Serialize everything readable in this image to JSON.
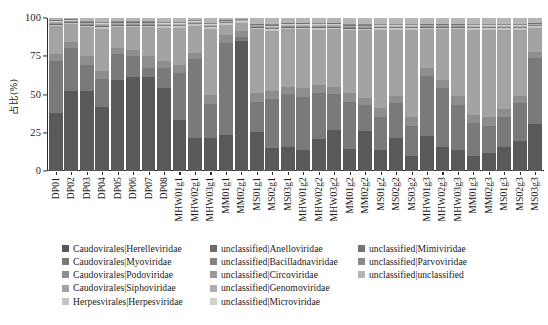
{
  "chart_data": {
    "type": "bar",
    "subtype": "stacked-percentage",
    "title": "",
    "xlabel": "",
    "ylabel": "占比(%)",
    "ylim": [
      0,
      100
    ],
    "yticks": [
      0,
      25,
      50,
      75,
      100
    ],
    "ytick_labels": [
      "0",
      "25",
      "50",
      "75",
      "100"
    ],
    "grid": false,
    "legend_position": "bottom",
    "legend_columns": 3,
    "palette": [
      "#595959",
      "#7a7a7a",
      "#8e8e8e",
      "#a3a3a3",
      "#c4c4c4",
      "#6b6b6b",
      "#848484",
      "#999999",
      "#adadad",
      "#d0d0d0",
      "#737373",
      "#8a8a8a",
      "#b5b5b5"
    ],
    "categories": [
      "DP01",
      "DP02",
      "DP03",
      "DP04",
      "DP05",
      "DP06",
      "DP07",
      "DP08",
      "MHW01g1",
      "MHW02g1",
      "MHW03g1",
      "MM01g1",
      "MM02g1",
      "MS01g1",
      "MS02g1",
      "MS03g1",
      "MHW01g2",
      "MHW02g2",
      "MHW03g2",
      "MM01g2",
      "MM02g2",
      "MS01g2",
      "MS02g2",
      "MS03g2",
      "MHW01g3",
      "MHW02g3",
      "MHW03g3",
      "MM01g3",
      "MM02g3",
      "MS01g3",
      "MS02g3",
      "MS03g3"
    ],
    "series": [
      {
        "name": "Caudovirales|Herelleviridae",
        "color": "#595959",
        "values": [
          38,
          53,
          53,
          42,
          60,
          62,
          62,
          55,
          34,
          22,
          22,
          24,
          85,
          26,
          15,
          16,
          14,
          21,
          27,
          15,
          27,
          14,
          22,
          10,
          23,
          16,
          14,
          10,
          12,
          16,
          20,
          31
        ]
      },
      {
        "name": "Caudovirales|Myoviridae",
        "color": "#7a7a7a",
        "values": [
          34,
          28,
          17,
          19,
          17,
          14,
          6,
          13,
          31,
          52,
          22,
          61,
          3,
          20,
          33,
          35,
          35,
          31,
          24,
          31,
          17,
          22,
          23,
          20,
          40,
          39,
          30,
          22,
          18,
          20,
          25,
          44
        ]
      },
      {
        "name": "Caudovirales|Podoviridae",
        "color": "#8e8e8e",
        "values": [
          5,
          4,
          6,
          5,
          4,
          4,
          8,
          5,
          5,
          4,
          6,
          5,
          4,
          6,
          5,
          5,
          6,
          5,
          5,
          6,
          5,
          6,
          5,
          6,
          5,
          5,
          6,
          5,
          6,
          5,
          5,
          4
        ]
      },
      {
        "name": "Caudovirales|Siphoviridae",
        "color": "#a3a3a3",
        "values": [
          18,
          12,
          19,
          28,
          14,
          15,
          19,
          22,
          25,
          18,
          44,
          7,
          5,
          42,
          40,
          38,
          39,
          37,
          38,
          42,
          45,
          52,
          44,
          58,
          26,
          34,
          44,
          57,
          58,
          53,
          44,
          16
        ]
      },
      {
        "name": "Herpesvirales|Herpesviridae",
        "color": "#c4c4c4",
        "values": [
          1,
          1,
          1,
          1,
          1,
          1,
          1,
          1,
          1,
          1,
          1,
          1,
          1,
          1,
          1,
          1,
          1,
          1,
          1,
          1,
          1,
          1,
          1,
          1,
          1,
          1,
          1,
          1,
          1,
          1,
          1,
          1
        ]
      },
      {
        "name": "unclassified|Anelloviridae",
        "color": "#6b6b6b",
        "values": [
          0.5,
          0.3,
          0.4,
          0.5,
          0.4,
          0.4,
          0.4,
          0.4,
          0.4,
          0.3,
          0.4,
          0.3,
          0.2,
          0.4,
          0.5,
          0.5,
          0.5,
          0.5,
          0.5,
          0.4,
          0.4,
          0.4,
          0.4,
          0.4,
          0.4,
          0.4,
          0.4,
          0.4,
          0.4,
          0.4,
          0.4,
          0.3
        ]
      },
      {
        "name": "unclassified|Bacilladnaviridae",
        "color": "#848484",
        "values": [
          0.4,
          0.3,
          0.3,
          0.4,
          0.3,
          0.3,
          0.3,
          0.3,
          0.3,
          0.3,
          0.3,
          0.3,
          0.2,
          0.3,
          0.4,
          0.4,
          0.4,
          0.4,
          0.4,
          0.3,
          0.3,
          0.3,
          0.3,
          0.3,
          0.3,
          0.3,
          0.3,
          0.3,
          0.3,
          0.3,
          0.3,
          0.3
        ]
      },
      {
        "name": "unclassified|Circoviridae",
        "color": "#999999",
        "values": [
          0.5,
          0.4,
          0.4,
          0.5,
          0.4,
          0.4,
          0.4,
          0.4,
          0.4,
          0.4,
          0.4,
          0.3,
          0.2,
          0.4,
          0.5,
          0.5,
          0.5,
          0.5,
          0.5,
          0.4,
          0.4,
          0.4,
          0.4,
          0.4,
          0.4,
          0.4,
          0.4,
          0.4,
          0.4,
          0.4,
          0.4,
          0.3
        ]
      },
      {
        "name": "unclassified|Genomoviridae",
        "color": "#adadad",
        "values": [
          0.5,
          0.4,
          0.4,
          0.5,
          0.4,
          0.4,
          0.4,
          0.4,
          0.4,
          0.4,
          0.4,
          0.3,
          0.2,
          0.4,
          0.5,
          0.5,
          0.5,
          0.5,
          0.5,
          0.4,
          0.4,
          0.4,
          0.4,
          0.4,
          0.4,
          0.4,
          0.4,
          0.4,
          0.4,
          0.4,
          0.4,
          0.3
        ]
      },
      {
        "name": "unclassified|Microviridae",
        "color": "#d0d0d0",
        "values": [
          0.6,
          0.4,
          0.5,
          0.6,
          0.5,
          0.5,
          0.5,
          0.5,
          0.5,
          0.4,
          0.5,
          0.4,
          0.2,
          0.5,
          0.6,
          0.6,
          0.6,
          0.6,
          0.6,
          0.5,
          0.5,
          0.5,
          0.5,
          0.5,
          0.5,
          0.5,
          0.5,
          0.5,
          0.5,
          0.5,
          0.5,
          0.4
        ]
      },
      {
        "name": "unclassified|Mimiviridae",
        "color": "#737373",
        "values": [
          0.5,
          0.4,
          0.4,
          0.5,
          0.4,
          0.4,
          0.4,
          0.4,
          0.4,
          0.4,
          0.4,
          0.3,
          0.2,
          0.4,
          0.5,
          0.5,
          0.5,
          0.5,
          0.5,
          0.4,
          0.4,
          0.4,
          0.4,
          0.4,
          0.4,
          0.4,
          0.4,
          0.4,
          0.4,
          0.4,
          0.4,
          0.3
        ]
      },
      {
        "name": "unclassified|Parvoviridae",
        "color": "#8a8a8a",
        "values": [
          0.5,
          0.4,
          0.4,
          0.5,
          0.4,
          0.4,
          0.4,
          0.4,
          0.4,
          0.4,
          0.4,
          0.3,
          0.2,
          0.4,
          0.5,
          0.5,
          0.5,
          0.5,
          0.5,
          0.4,
          0.4,
          0.4,
          0.4,
          0.4,
          0.4,
          0.4,
          0.4,
          0.4,
          0.4,
          0.4,
          0.4,
          0.3
        ]
      },
      {
        "name": "unclassified|unclassified",
        "color": "#b5b5b5",
        "values": [
          1,
          0.4,
          2.2,
          2.5,
          2.2,
          2.2,
          2.2,
          2.6,
          2.6,
          1.4,
          3.2,
          1.1,
          0.8,
          3.6,
          4.1,
          3.1,
          3.1,
          3.1,
          3.1,
          4.2,
          4.2,
          4.1,
          4.1,
          4.1,
          3.6,
          3.6,
          3.6,
          4.1,
          4.1,
          4.1,
          4.1,
          3.1
        ]
      }
    ]
  },
  "axes": {
    "y_title": "占比(%)",
    "y_tick_labels": [
      "100",
      "75",
      "50",
      "25",
      "0"
    ],
    "x_tick_labels": [
      "DP01",
      "DP02",
      "DP03",
      "DP04",
      "DP05",
      "DP06",
      "DP07",
      "DP08",
      "MHW01g1",
      "MHW02g1",
      "MHW03g1",
      "MM01g1",
      "MM02g1",
      "MS01g1",
      "MS02g1",
      "MS03g1",
      "MHW01g2",
      "MHW02g2",
      "MHW03g2",
      "MM01g2",
      "MM02g2",
      "MS01g2",
      "MS02g2",
      "MS03g2",
      "MHW01g3",
      "MHW02g3",
      "MHW03g3",
      "MM01g3",
      "MM02g3",
      "MS01g3",
      "MS02g3",
      "MS03g3"
    ]
  },
  "legend": {
    "columns": [
      [
        {
          "label": "Caudovirales|Herelleviridae",
          "color": "#595959"
        },
        {
          "label": "Caudovirales|Myoviridae",
          "color": "#7a7a7a"
        },
        {
          "label": "Caudovirales|Podoviridae",
          "color": "#8e8e8e"
        },
        {
          "label": "Caudovirales|Siphoviridae",
          "color": "#a3a3a3"
        },
        {
          "label": "Herpesvirales|Herpesviridae",
          "color": "#c4c4c4"
        }
      ],
      [
        {
          "label": "unclassified|Anelloviridae",
          "color": "#6b6b6b"
        },
        {
          "label": "unclassified|Bacilladnaviridae",
          "color": "#848484"
        },
        {
          "label": "unclassified|Circoviridae",
          "color": "#999999"
        },
        {
          "label": "unclassified|Genomoviridae",
          "color": "#adadad"
        },
        {
          "label": "unclassified|Microviridae",
          "color": "#d0d0d0"
        }
      ],
      [
        {
          "label": "unclassified|Mimiviridae",
          "color": "#737373"
        },
        {
          "label": "unclassified|Parvoviridae",
          "color": "#8a8a8a"
        },
        {
          "label": "unclassified|unclassified",
          "color": "#b5b5b5"
        }
      ]
    ]
  }
}
